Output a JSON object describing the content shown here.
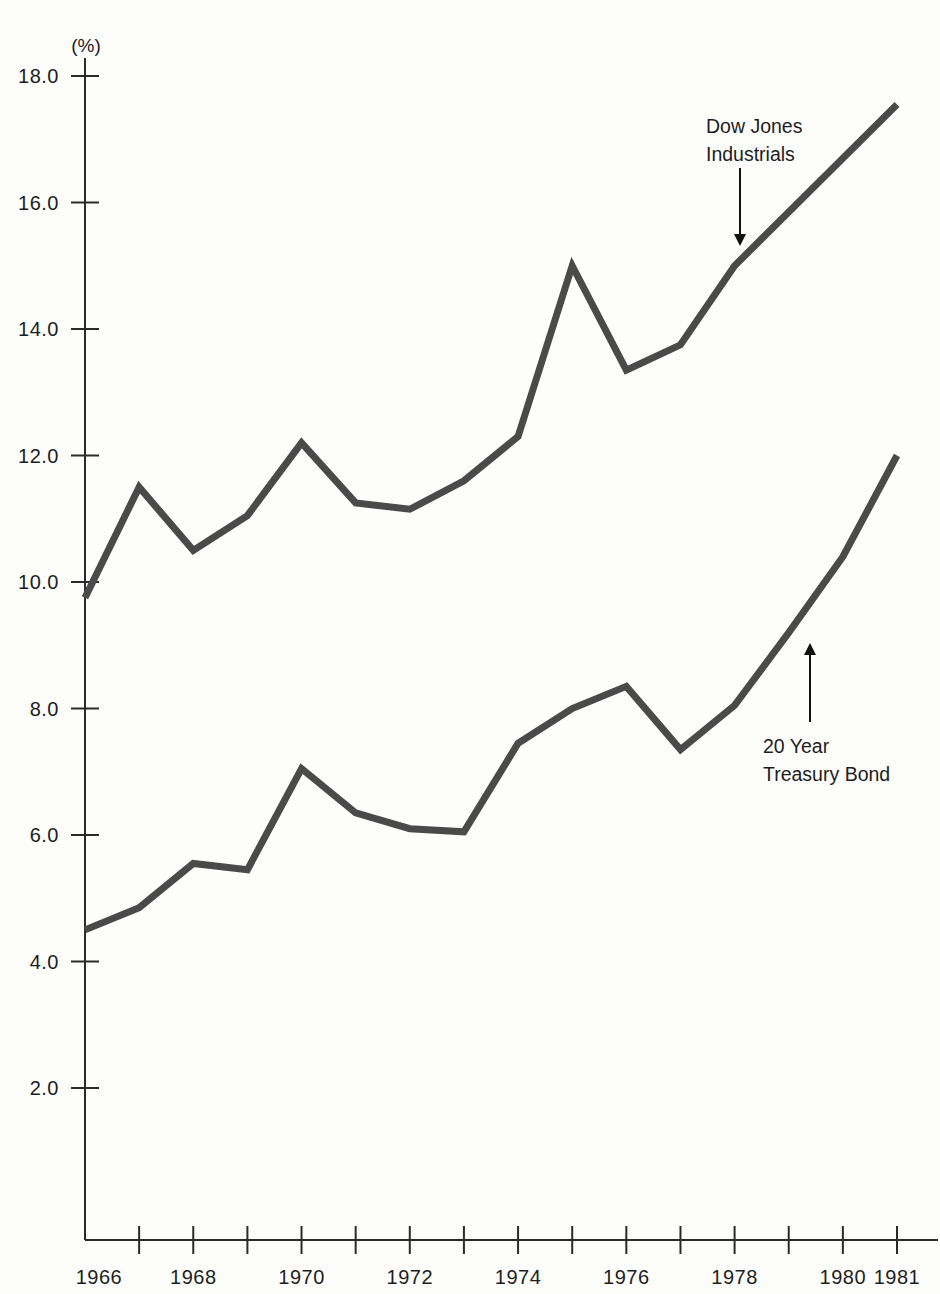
{
  "chart_data": {
    "type": "line",
    "title": "",
    "subtitle": "",
    "xlabel": "",
    "ylabel": "",
    "unit_label": "(%)",
    "grid": false,
    "legend_position": "inline-annotations",
    "x": [
      1966,
      1967,
      1968,
      1969,
      1970,
      1971,
      1972,
      1973,
      1974,
      1975,
      1976,
      1977,
      1978,
      1979,
      1980,
      1981
    ],
    "xlim": [
      1966,
      1981
    ],
    "ylim": [
      0.0,
      18.0
    ],
    "y_ticks": [
      18.0,
      16.0,
      14.0,
      12.0,
      10.0,
      8.0,
      6.0,
      4.0,
      2.0
    ],
    "y_tick_labels": [
      "18.0",
      "16.0",
      "14.0",
      "12.0",
      "10.0",
      "8.0",
      "6.0",
      "4.0",
      "2.0"
    ],
    "x_ticks": [
      1966,
      1967,
      1968,
      1969,
      1970,
      1971,
      1972,
      1973,
      1974,
      1975,
      1976,
      1977,
      1978,
      1979,
      1980,
      1981
    ],
    "x_tick_labels": [
      "1966",
      "",
      "1968",
      "",
      "1970",
      "",
      "1972",
      "",
      "1974",
      "",
      "1976",
      "",
      "1978",
      "",
      "1980",
      "1981"
    ],
    "x_labeled_ticks": [
      "1966",
      "1968",
      "1970",
      "1972",
      "1974",
      "1976",
      "1978",
      "1980",
      "1981"
    ],
    "series": [
      {
        "name": "Dow Jones Industrials",
        "color": "#4a4a4a",
        "values": [
          9.75,
          11.5,
          10.5,
          11.05,
          12.2,
          11.25,
          11.15,
          11.6,
          12.3,
          15.0,
          13.35,
          13.75,
          15.0,
          15.85,
          16.7,
          17.55
        ]
      },
      {
        "name": "20 Year Treasury Bond",
        "color": "#4a4a4a",
        "values": [
          4.5,
          4.85,
          5.55,
          5.45,
          7.05,
          6.35,
          6.1,
          6.05,
          7.45,
          8.0,
          8.35,
          7.35,
          8.05,
          9.2,
          10.4,
          12.0
        ]
      }
    ],
    "annotations": [
      {
        "id": "dow-jones-annotation",
        "lines": [
          "Dow Jones",
          "Industrials"
        ],
        "arrow_direction": "down",
        "points_to_year": 1978,
        "points_to_value": 15.0
      },
      {
        "id": "treasury-bond-annotation",
        "lines": [
          "20 Year",
          "Treasury Bond"
        ],
        "arrow_direction": "up",
        "points_to_year": 1979,
        "points_to_value": 9.2
      }
    ]
  },
  "colors": {
    "line": "#4a4a4a",
    "axis": "#2a2a2a",
    "text": "#1d1d1d",
    "background": "#fdfdfc"
  }
}
